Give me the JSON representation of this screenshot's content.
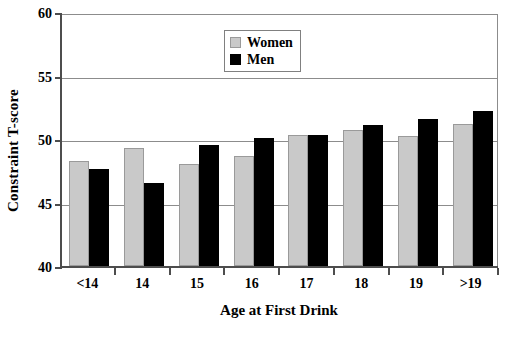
{
  "chart_data": {
    "type": "bar",
    "title": "",
    "xlabel": "Age at First Drink",
    "ylabel": "Constraint T-score",
    "categories": [
      "<14",
      "14",
      "15",
      "16",
      "17",
      "18",
      "19",
      ">19"
    ],
    "series": [
      {
        "name": "Women",
        "color": "#c9c9c9",
        "values": [
          48.3,
          49.3,
          48.0,
          48.7,
          50.3,
          50.7,
          50.2,
          51.2
        ]
      },
      {
        "name": "Men",
        "color": "#000000",
        "values": [
          47.6,
          46.5,
          49.5,
          50.1,
          50.3,
          51.1,
          51.6,
          52.2
        ]
      }
    ],
    "ylim": [
      40,
      60
    ],
    "yticks": [
      40,
      45,
      50,
      55,
      60
    ],
    "ytick_labels": [
      "40",
      "45",
      "50",
      "55",
      "60"
    ],
    "grid": true,
    "grid_axis": "y",
    "legend_position": "top-center"
  },
  "legend": {
    "items": [
      {
        "label": "Women",
        "swatch": "gray-square-icon"
      },
      {
        "label": "Men",
        "swatch": "black-square-icon"
      }
    ]
  },
  "caption": {
    "text": ""
  }
}
